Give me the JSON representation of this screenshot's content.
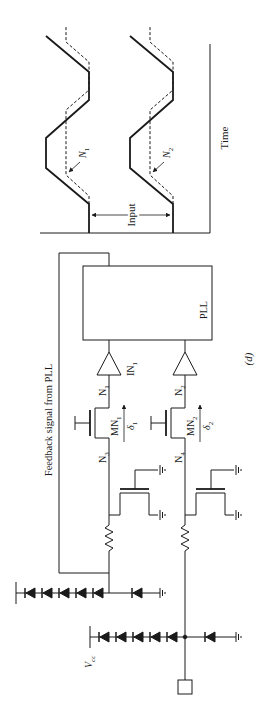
{
  "figure": {
    "label": "(d)",
    "orientation": "rotated-90-ccw"
  },
  "waveform": {
    "time_label": "Time",
    "input_label": "Input",
    "node_labels": [
      "N1",
      "N2"
    ],
    "n1_main": "N",
    "n1_sub": "1",
    "n2_main": "N",
    "n2_sub": "2"
  },
  "circuit": {
    "pll_label": "PLL",
    "feedback_label": "Feedback signal from PLL",
    "buffer1_main": "IN",
    "buffer1_sub": "1",
    "node_n1_main": "N",
    "node_n1_sub": "1",
    "node_n2_main": "N",
    "node_n2_sub": "2",
    "node_n3_main": "N",
    "node_n3_sub": "3",
    "node_n4_main": "N",
    "node_n4_sub": "4",
    "mn1_main": "MN",
    "mn1_sub": "1",
    "mn2_main": "MN",
    "mn2_sub": "2",
    "delta1_main": "δ",
    "delta1_sub": "1",
    "delta2_main": "δ",
    "delta2_sub": "2",
    "vcc_main": "V",
    "vcc_sub": "cc",
    "diode_chain_count": 5
  }
}
